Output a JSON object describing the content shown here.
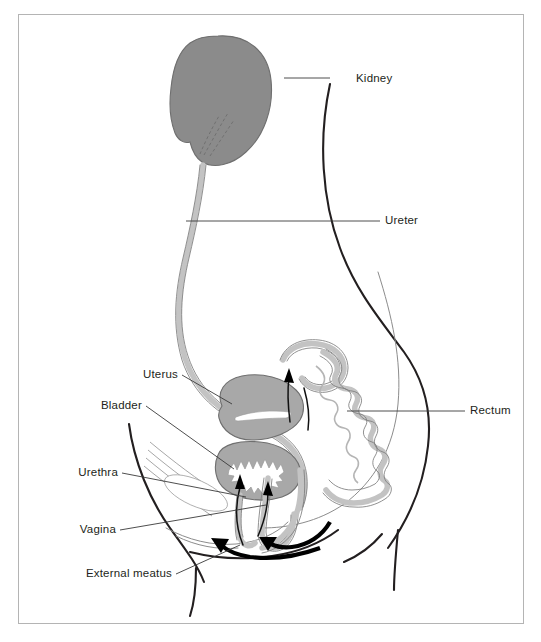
{
  "figure": {
    "background_color": "#ffffff",
    "frame_color": "#b4b4b4"
  },
  "labels": [
    {
      "id": "kidney",
      "text": "Kidney",
      "side": "right",
      "text_x": 356,
      "text_y": 82,
      "line": "M 330 78 L 284 78"
    },
    {
      "id": "ureter",
      "text": "Ureter",
      "side": "right",
      "text_x": 385,
      "text_y": 224,
      "line": "M 380 221 L 186 221"
    },
    {
      "id": "rectum",
      "text": "Rectum",
      "side": "right",
      "text_x": 470,
      "text_y": 414,
      "line": "M 465 411 L 347 411"
    },
    {
      "id": "uterus",
      "text": "Uterus",
      "side": "left",
      "text_x": 178,
      "text_y": 378,
      "line": "M 182 375 L 232 404"
    },
    {
      "id": "bladder",
      "text": "Bladder",
      "side": "left",
      "text_x": 142,
      "text_y": 409,
      "line": "M 146 406 L 234 469"
    },
    {
      "id": "urethra",
      "text": "Urethra",
      "side": "left",
      "text_x": 118,
      "text_y": 476,
      "line": "M 122 473 L 246 497"
    },
    {
      "id": "vagina",
      "text": "Vagina",
      "side": "left",
      "text_x": 116,
      "text_y": 533,
      "line": "M 120 530 L 266 505"
    },
    {
      "id": "external-meatus",
      "text": "External meatus",
      "side": "left",
      "text_x": 72,
      "text_y": 577,
      "line": "M 176 574 L 240 545"
    }
  ],
  "structures": {
    "kidney": {
      "name": "Kidney",
      "fill": "#8b8b8b",
      "stroke": "#6f6f6f"
    },
    "ureter": {
      "name": "Ureter",
      "fill": "#d4d4d4",
      "stroke": "#8a8a8a"
    },
    "uterus": {
      "name": "Uterus",
      "fill": "#a8a8a8",
      "stroke": "#6f6f6f"
    },
    "bladder": {
      "name": "Bladder",
      "fill": "#a8a8a8",
      "stroke": "#6f6f6f"
    },
    "rectum": {
      "name": "Rectum",
      "fill": "#c3c3c3",
      "stroke": "#7d7d7d"
    },
    "vagina": {
      "name": "Vagina",
      "fill": "#c3c3c3",
      "stroke": "#7d7d7d"
    },
    "body_outline": {
      "name": "Body outline",
      "stroke": "#231f20"
    }
  },
  "arrows": [
    {
      "id": "urine-flow-arrow",
      "description": "upward arrow into bladder",
      "color": "#111111"
    },
    {
      "id": "ureter-peristalsis-arrow",
      "description": "upward arrow along ureter",
      "color": "#111111"
    },
    {
      "id": "perineum-arrow-left",
      "description": "thick curved arrow toward external meatus",
      "color": "#000000"
    },
    {
      "id": "perineum-arrow-right",
      "description": "thick curved arrow toward vaginal opening",
      "color": "#000000"
    }
  ]
}
